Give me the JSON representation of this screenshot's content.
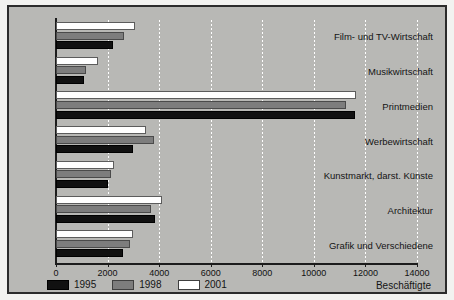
{
  "chart_data": {
    "type": "bar",
    "orientation": "horizontal",
    "title": "",
    "xlabel": "Beschäftigte",
    "ylabel": "",
    "xlim": [
      0,
      14000
    ],
    "grid": true,
    "legend_position": "bottom-left",
    "categories": [
      "Film- und TV-Wirtschaft",
      "Musikwirtschaft",
      "Printmedien",
      "Werbewirtschaft",
      "Kunstmarkt, darst. Künste",
      "Architektur",
      "Grafik und Verschiedene"
    ],
    "tick_labels": [
      "0",
      "2000",
      "4000",
      "6000",
      "8000",
      "10000",
      "12000",
      "14000"
    ],
    "tick_values": [
      0,
      2000,
      4000,
      6000,
      8000,
      10000,
      12000,
      14000
    ],
    "series": [
      {
        "name": "1995",
        "color": "#111111",
        "values": [
          2210,
          1080,
          11590,
          2980,
          2010,
          3830,
          2590
        ]
      },
      {
        "name": "1998",
        "color": "#7d7d7d",
        "values": [
          2640,
          1160,
          11240,
          3800,
          2130,
          3700,
          2880
        ]
      },
      {
        "name": "2001",
        "color": "#ffffff",
        "values": [
          3060,
          1630,
          11630,
          3480,
          2260,
          4100,
          2980
        ]
      }
    ]
  },
  "legend": {
    "items": [
      {
        "label": "1995",
        "key": "s1995"
      },
      {
        "label": "1998",
        "key": "s1998"
      },
      {
        "label": "2001",
        "key": "s2001"
      }
    ]
  },
  "axis": {
    "unit_label": "Beschäftigte"
  },
  "colors": {
    "background": "#b8b8b5",
    "page": "#f2f2f0",
    "frame": "#2b2b2b",
    "gridline": "#ffffff",
    "axis": "#1c1c1c"
  }
}
